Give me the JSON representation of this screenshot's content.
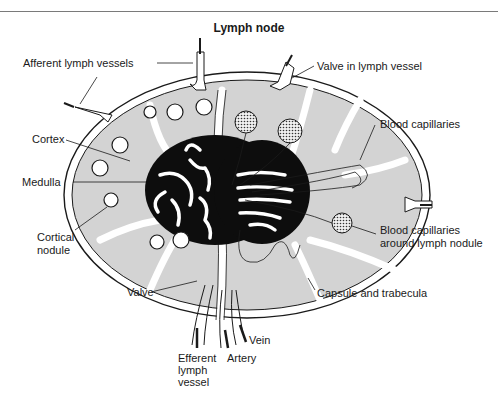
{
  "figure": {
    "title": "Lymph node",
    "colors": {
      "background": "#ffffff",
      "tissue": "#d3d3d3",
      "medulla": "#0d0d0d",
      "outline": "#1a1a1a",
      "rule": "#7a7a7a"
    },
    "labels": {
      "afferent": "Afferent lymph vessels",
      "valve_in_vessel": "Valve in lymph vessel",
      "blood_capillaries": "Blood capillaries",
      "cortex": "Cortex",
      "medulla": "Medulla",
      "cortical_nodule_1": "Cortical",
      "cortical_nodule_2": "nodule",
      "capillaries_nodule_1": "Blood capillaries",
      "capillaries_nodule_2": "around lymph nodule",
      "valve": "Valve",
      "capsule": "Capsule and trabecula",
      "vein": "Vein",
      "efferent_1": "Efferent",
      "efferent_2": "lymph",
      "efferent_3": "vessel",
      "artery": "Artery"
    }
  }
}
